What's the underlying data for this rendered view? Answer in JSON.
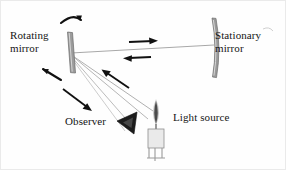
{
  "figure": {
    "name": "rotating-mirror-speed-of-light-diagram",
    "background_color": "#fefefe",
    "border_color": "#eaeaea",
    "width": 286,
    "height": 170
  },
  "labels": {
    "rotating_mirror": "Rotating\nmirror",
    "stationary_mirror": "Stationary\nmirror",
    "observer": "Observer",
    "light_source": "Light source"
  },
  "colors": {
    "ink": "#151515",
    "ray": "#a8a8a8",
    "mirror_fill": "#9a9a9a",
    "mirror_stroke": "#6f6f6f",
    "arrow": "#111111",
    "flame_outer": "#8c8c8c",
    "flame_inner": "#4a4a4a",
    "candle_body": "#e8e8e8",
    "candle_stroke": "#8e8e8e",
    "eye_fill": "#1a1a1a"
  },
  "elements": {
    "rotating_mirror": {
      "label": "Rotating mirror",
      "kind": "tilted-flat-mirror",
      "tilt_degrees": 18
    },
    "stationary_mirror": {
      "label": "Stationary mirror",
      "kind": "vertical-curved-mirror"
    },
    "observer": {
      "label": "Observer",
      "kind": "eye-viewing-cone"
    },
    "light_source": {
      "label": "Light source",
      "kind": "lit-candle"
    }
  },
  "arrows": {
    "beam_to_stationary": {
      "name": "arrow-right-outbound",
      "direction": "right",
      "description": "light travelling from rotating mirror to stationary mirror"
    },
    "beam_from_stationary": {
      "name": "arrow-left-return",
      "direction": "left",
      "description": "light returning from stationary mirror to rotating mirror"
    },
    "source_to_mirror": {
      "name": "arrow-up-left-incoming",
      "direction": "up-left",
      "description": "light from candle towards rotating mirror"
    },
    "mirror_to_observer": {
      "name": "arrow-down-right-outgoing",
      "direction": "down-right",
      "description": "reflected light from rotating mirror towards observer"
    },
    "rotation_top": {
      "name": "rotation-arrow-top",
      "direction": "clockwise",
      "description": "rotation of the mirror, upper curved arrow"
    },
    "rotation_bottom": {
      "name": "rotation-arrow-bottom",
      "direction": "clockwise",
      "description": "rotation of the mirror, lower curved arrow"
    }
  }
}
